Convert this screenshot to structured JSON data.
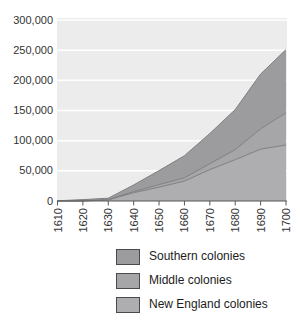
{
  "chart_data": {
    "type": "area",
    "stacked": true,
    "title": "",
    "xlabel": "",
    "ylabel": "",
    "x": [
      1610,
      1620,
      1630,
      1640,
      1650,
      1660,
      1670,
      1680,
      1690,
      1700
    ],
    "x_tick_labels": [
      "1610",
      "1620",
      "1630",
      "1640",
      "1650",
      "1660",
      "1670",
      "1680",
      "1690",
      "1700"
    ],
    "ylim": [
      0,
      300000
    ],
    "y_tick_step": 50000,
    "y_tick_labels": [
      "0",
      "50,000",
      "100,000",
      "150,000",
      "200,000",
      "250,000",
      "300,000"
    ],
    "grid": "horizontal",
    "series_bottom_to_top": [
      {
        "name": "New England colonies",
        "color": "#aeaeb0",
        "values": [
          0,
          100,
          1800,
          13700,
          22900,
          33000,
          52000,
          68500,
          86000,
          92800
        ]
      },
      {
        "name": "Middle colonies",
        "color": "#a6a6a8",
        "values": [
          0,
          0,
          350,
          1900,
          4300,
          5500,
          9800,
          16600,
          33600,
          53500
        ]
      },
      {
        "name": "Southern colonies",
        "color": "#9c9c9e",
        "values": [
          350,
          2200,
          2500,
          11000,
          23200,
          36600,
          50100,
          66400,
          90800,
          104600
        ]
      }
    ],
    "colors": {
      "plot_background": "#ececec",
      "gridline": "#ffffff",
      "boundary_line": "#7f7f83",
      "axis_line": "#58585a",
      "tick_label": "#333333"
    },
    "legend_position": "below"
  },
  "legend": {
    "items": [
      {
        "label": "Southern colonies",
        "color": "#9c9c9e"
      },
      {
        "label": "Middle colonies",
        "color": "#a6a6a8"
      },
      {
        "label": "New England colonies",
        "color": "#aeaeb0"
      }
    ]
  }
}
